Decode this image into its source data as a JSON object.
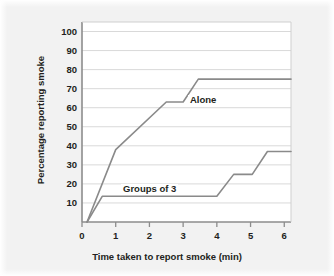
{
  "figure": {
    "background_color": "#f2f2f2",
    "plot_background_color": "#ffffff",
    "frame_color": "#8c8c8c",
    "grid_color": "#d9d9d9",
    "text_color": "#231f20"
  },
  "chart_data": {
    "type": "line",
    "title": "",
    "subtitle": "",
    "xlabel": "Time taken to report smoke (min)",
    "ylabel": "Percentage reporting smoke",
    "xlim": [
      0,
      6.2
    ],
    "ylim": [
      0,
      105
    ],
    "xticks": [
      0,
      1,
      2,
      3,
      4,
      5,
      6
    ],
    "xtick_labels": [
      "0",
      "1",
      "2",
      "3",
      "4",
      "5",
      "6"
    ],
    "yticks": [
      10,
      20,
      30,
      40,
      50,
      60,
      70,
      80,
      90,
      100
    ],
    "ytick_labels": [
      "10",
      "20",
      "30",
      "40",
      "50",
      "60",
      "70",
      "80",
      "90",
      "100"
    ],
    "grid": "horizontal",
    "legend_position": "inline-annotation",
    "line_color": "#8a8a8a",
    "line_width": 1.6,
    "series": [
      {
        "name": "Alone",
        "color": "#8a8a8a",
        "label_x": 3.2,
        "label_y": 68,
        "x": [
          0.15,
          1.0,
          2.5,
          3.0,
          3.45,
          6.2
        ],
        "y": [
          0,
          38,
          63,
          63,
          75,
          75
        ],
        "points": [
          {
            "x": 0.15,
            "y": 0
          },
          {
            "x": 1.0,
            "y": 38
          },
          {
            "x": 2.5,
            "y": 63
          },
          {
            "x": 3.0,
            "y": 63
          },
          {
            "x": 3.45,
            "y": 75
          },
          {
            "x": 6.2,
            "y": 75
          }
        ]
      },
      {
        "name": "Groups of 3",
        "color": "#8a8a8a",
        "label_x": 1.3,
        "label_y": 17,
        "x": [
          0.15,
          0.6,
          4.0,
          4.5,
          5.05,
          5.5,
          6.2
        ],
        "y": [
          0,
          13.5,
          13.5,
          25,
          25,
          37,
          37
        ],
        "points": [
          {
            "x": 0.15,
            "y": 0
          },
          {
            "x": 0.6,
            "y": 13.5
          },
          {
            "x": 4.0,
            "y": 13.5
          },
          {
            "x": 4.5,
            "y": 25
          },
          {
            "x": 5.05,
            "y": 25
          },
          {
            "x": 5.5,
            "y": 37
          },
          {
            "x": 6.2,
            "y": 37
          }
        ]
      }
    ]
  }
}
